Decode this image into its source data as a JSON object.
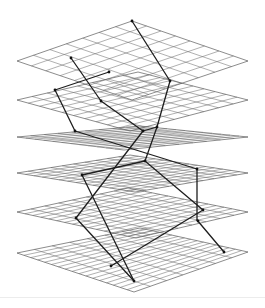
{
  "diagram": {
    "width": 265,
    "height": 308,
    "colors": {
      "grid": "#6e6e6e",
      "border": "#5a5a5a",
      "path": "#1e1e1e",
      "node": "#111111",
      "background": "#ffffff"
    },
    "planes": [
      {
        "id": "plane-1",
        "corners": {
          "top": [
            132,
            21
          ],
          "right": [
            248,
            61
          ],
          "bottom": [
            132,
            100
          ],
          "left": [
            17,
            61
          ]
        },
        "divisions_a": 7,
        "divisions_b": 8
      },
      {
        "id": "plane-2",
        "corners": {
          "top": [
            138,
            72
          ],
          "right": [
            248,
            100
          ],
          "bottom": [
            130,
            131
          ],
          "left": [
            17,
            100
          ]
        },
        "divisions_a": 8,
        "divisions_b": 10
      },
      {
        "id": "plane-3",
        "corners": {
          "top": [
            140,
            126
          ],
          "right": [
            248,
            137
          ],
          "bottom": [
            124,
            150
          ],
          "left": [
            17,
            137
          ]
        },
        "divisions_a": 9,
        "divisions_b": 12
      },
      {
        "id": "plane-4",
        "corners": {
          "top": [
            130,
            155
          ],
          "right": [
            248,
            173
          ],
          "bottom": [
            135,
            192
          ],
          "left": [
            17,
            173
          ]
        },
        "divisions_a": 10,
        "divisions_b": 14
      },
      {
        "id": "plane-5",
        "corners": {
          "top": [
            128,
            188
          ],
          "right": [
            248,
            212
          ],
          "bottom": [
            136,
            238
          ],
          "left": [
            17,
            212
          ]
        },
        "divisions_a": 8,
        "divisions_b": 15
      },
      {
        "id": "plane-6",
        "corners": {
          "top": [
            140,
            228
          ],
          "right": [
            248,
            252
          ],
          "bottom": [
            134,
            292
          ],
          "left": [
            17,
            253
          ]
        },
        "divisions_a": 7,
        "divisions_b": 17
      }
    ],
    "path_points": [
      [
        132,
        21
      ],
      [
        170,
        81
      ],
      [
        157,
        127
      ],
      [
        145,
        161
      ],
      [
        82,
        175
      ],
      [
        134,
        281
      ]
    ],
    "path_points_2": [
      [
        71,
        58
      ],
      [
        101,
        101
      ],
      [
        143,
        131
      ],
      [
        116,
        162
      ],
      [
        76,
        218
      ],
      [
        134,
        281
      ]
    ],
    "segments": [
      [
        [
          132,
          21
        ],
        [
          170,
          81
        ]
      ],
      [
        [
          170,
          81
        ],
        [
          157,
          127
        ]
      ],
      [
        [
          157,
          127
        ],
        [
          145,
          161
        ]
      ],
      [
        [
          145,
          161
        ],
        [
          82,
          175
        ]
      ],
      [
        [
          82,
          175
        ],
        [
          134,
          281
        ]
      ],
      [
        [
          71,
          58
        ],
        [
          101,
          101
        ]
      ],
      [
        [
          101,
          101
        ],
        [
          143,
          131
        ]
      ],
      [
        [
          143,
          131
        ],
        [
          157,
          127
        ]
      ],
      [
        [
          109,
          72
        ],
        [
          55,
          90
        ]
      ],
      [
        [
          55,
          90
        ],
        [
          75,
          131
        ]
      ],
      [
        [
          75,
          131
        ],
        [
          197,
          169
        ]
      ],
      [
        [
          197,
          169
        ],
        [
          197,
          220
        ]
      ],
      [
        [
          197,
          220
        ],
        [
          224,
          252
        ]
      ],
      [
        [
          143,
          131
        ],
        [
          76,
          218
        ]
      ],
      [
        [
          76,
          218
        ],
        [
          134,
          281
        ]
      ],
      [
        [
          203,
          210
        ],
        [
          111,
          266
        ]
      ],
      [
        [
          145,
          161
        ],
        [
          203,
          210
        ]
      ]
    ],
    "nodes": [
      [
        132,
        21
      ],
      [
        170,
        81
      ],
      [
        71,
        58
      ],
      [
        109,
        72
      ],
      [
        55,
        90
      ],
      [
        101,
        101
      ],
      [
        75,
        131
      ],
      [
        143,
        131
      ],
      [
        157,
        127
      ],
      [
        145,
        161
      ],
      [
        197,
        169
      ],
      [
        82,
        175
      ],
      [
        203,
        210
      ],
      [
        198,
        221
      ],
      [
        76,
        218
      ],
      [
        224,
        252
      ],
      [
        111,
        266
      ],
      [
        134,
        281
      ]
    ]
  }
}
